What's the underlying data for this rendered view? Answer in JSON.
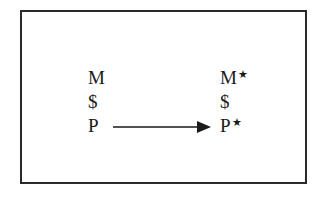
{
  "diagram": {
    "left_column": [
      {
        "symbol": "M"
      },
      {
        "symbol": "$"
      },
      {
        "symbol": "P"
      }
    ],
    "right_column": [
      {
        "symbol": "M",
        "marker": "★"
      },
      {
        "symbol": "$"
      },
      {
        "symbol": "P",
        "marker": "★"
      }
    ],
    "arrow": {
      "from": "P",
      "to": "P★",
      "direction": "right"
    },
    "colors": {
      "ink": "#1a1a1a",
      "border": "#2a2a2a",
      "background": "#ffffff"
    }
  }
}
